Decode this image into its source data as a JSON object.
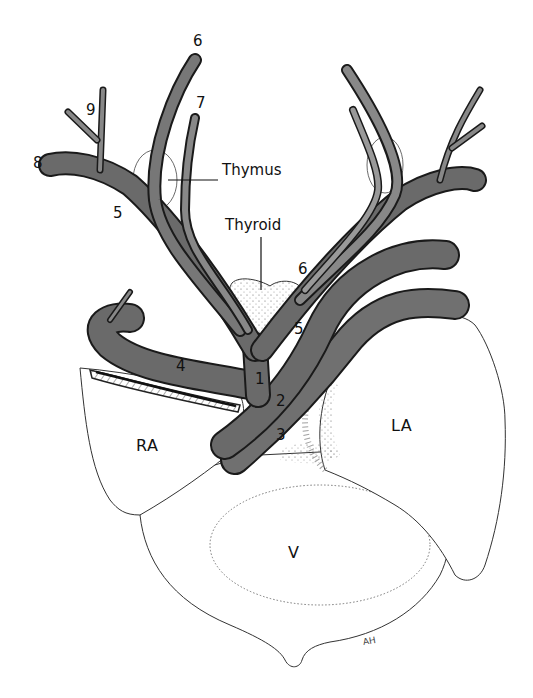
{
  "figure": {
    "type": "anatomical-diagram",
    "colors": {
      "vessel_fill": "#6e6e6e",
      "vessel_outline": "#1a1a1a",
      "vessel_highlight": "#e8e8e8",
      "organ_fill": "#ffffff",
      "stipple": "#555555",
      "background": "#ffffff"
    }
  },
  "labels": {
    "vessels": [
      {
        "id": "1",
        "text": "1"
      },
      {
        "id": "2",
        "text": "2"
      },
      {
        "id": "3",
        "text": "3"
      },
      {
        "id": "4",
        "text": "4"
      },
      {
        "id": "5_left",
        "text": "5"
      },
      {
        "id": "5_right",
        "text": "5"
      },
      {
        "id": "6_top",
        "text": "6"
      },
      {
        "id": "6_right",
        "text": "6"
      },
      {
        "id": "7",
        "text": "7"
      },
      {
        "id": "8",
        "text": "8"
      },
      {
        "id": "9",
        "text": "9"
      }
    ],
    "organs": {
      "thymus": "Thymus",
      "thyroid": "Thyroid"
    },
    "chambers": {
      "right_atrium": "RA",
      "left_atrium": "LA",
      "ventricle": "V"
    },
    "signature": "AH"
  }
}
